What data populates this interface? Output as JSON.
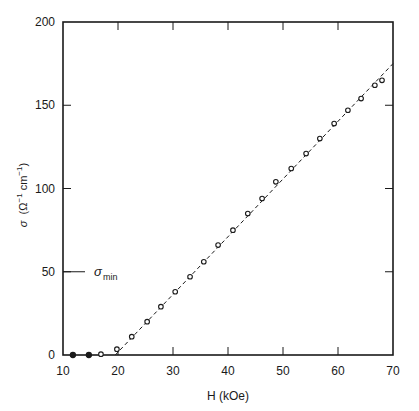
{
  "chart_data": {
    "type": "scatter",
    "title": "",
    "xlabel": "H (kOe)",
    "ylabel": "σ (Ω⁻¹ cm⁻¹)",
    "xlim": [
      10,
      70
    ],
    "ylim": [
      0,
      200
    ],
    "xticks": [
      10,
      20,
      30,
      40,
      50,
      60,
      70
    ],
    "yticks": [
      0,
      50,
      100,
      150,
      200
    ],
    "grid": false,
    "legend": null,
    "annotations": [
      {
        "text": "σ",
        "subscript": "min",
        "y": 50,
        "note": "tick mark at σ = 50 labeled σ_min"
      }
    ],
    "series": [
      {
        "name": "filled points",
        "marker": "filled-circle",
        "x": [
          11.8,
          14.7
        ],
        "y": [
          0,
          0
        ]
      },
      {
        "name": "open points",
        "marker": "open-circle",
        "x": [
          16.9,
          19.8,
          22.5,
          25.3,
          27.8,
          30.4,
          33.1,
          35.6,
          38.2,
          40.9,
          43.6,
          46.2,
          48.7,
          51.5,
          54.2,
          56.7,
          59.3,
          61.8,
          64.2,
          66.7,
          68.0
        ],
        "y": [
          0.5,
          3.5,
          11,
          20,
          29,
          38,
          47,
          56,
          66,
          75,
          85,
          94,
          104,
          112,
          121,
          130,
          139,
          147,
          154,
          162,
          165
        ]
      },
      {
        "name": "linear fit",
        "style": "dashed-line",
        "x": [
          19.5,
          70
        ],
        "y": [
          0,
          175
        ]
      }
    ]
  },
  "labels": {
    "xlabel": "H (kOe)",
    "ylabel_sigma": "σ",
    "ylabel_units": "(Ω",
    "ylabel_exp1": "−1",
    "ylabel_cm": " cm",
    "ylabel_exp2": "−1",
    "ylabel_close": ")",
    "sigma_min_symbol": "σ",
    "sigma_min_sub": "min"
  },
  "colors": {
    "ink": "#1a1a1a",
    "background": "#ffffff"
  }
}
